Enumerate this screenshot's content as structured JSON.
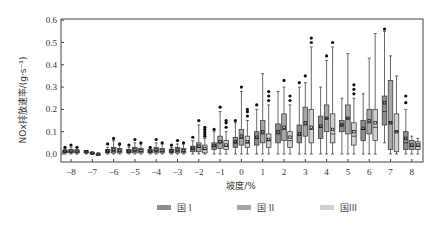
{
  "chart_data": {
    "type": "box",
    "title": "",
    "xlabel": "坡度/%",
    "ylabel": "NOx排放速率/(g·s⁻¹)",
    "ylim": [
      0.0,
      0.6
    ],
    "yticks": [
      "0.0",
      "0.1",
      "0.2",
      "0.3",
      "0.4",
      "0.5",
      "0.6"
    ],
    "categories": [
      "-8",
      "-7",
      "-6",
      "-5",
      "-4",
      "-3",
      "-2",
      "-1",
      "0",
      "1",
      "2",
      "3",
      "4",
      "5",
      "6",
      "7",
      "8"
    ],
    "grid": false,
    "legend_position": "bottom",
    "series": [
      {
        "name": "国 I",
        "color": "#8c8c8c",
        "boxes": [
          {
            "q1": 0.005,
            "median": 0.01,
            "q3": 0.018,
            "mean": 0.012,
            "low": 0.0,
            "high": 0.025,
            "outliers": [
              0.03
            ]
          },
          {
            "q1": 0.005,
            "median": 0.01,
            "q3": 0.015,
            "mean": 0.01,
            "low": 0.0,
            "high": 0.015,
            "outliers": []
          },
          {
            "q1": 0.005,
            "median": 0.012,
            "q3": 0.02,
            "mean": 0.012,
            "low": 0.0,
            "high": 0.03,
            "outliers": [
              0.045
            ]
          },
          {
            "q1": 0.005,
            "median": 0.012,
            "q3": 0.02,
            "mean": 0.012,
            "low": 0.0,
            "high": 0.03,
            "outliers": [
              0.04
            ]
          },
          {
            "q1": 0.005,
            "median": 0.012,
            "q3": 0.02,
            "mean": 0.012,
            "low": 0.0,
            "high": 0.025,
            "outliers": [
              0.03
            ]
          },
          {
            "q1": 0.005,
            "median": 0.012,
            "q3": 0.022,
            "mean": 0.014,
            "low": 0.0,
            "high": 0.03,
            "outliers": [
              0.04
            ]
          },
          {
            "q1": 0.01,
            "median": 0.022,
            "q3": 0.035,
            "mean": 0.025,
            "low": 0.0,
            "high": 0.06,
            "outliers": [
              0.075
            ]
          },
          {
            "q1": 0.02,
            "median": 0.035,
            "q3": 0.05,
            "mean": 0.038,
            "low": 0.0,
            "high": 0.1,
            "outliers": [
              0.11
            ]
          },
          {
            "q1": 0.03,
            "median": 0.05,
            "q3": 0.075,
            "mean": 0.055,
            "low": 0.0,
            "high": 0.14,
            "outliers": [
              0.15
            ]
          },
          {
            "q1": 0.04,
            "median": 0.07,
            "q3": 0.1,
            "mean": 0.075,
            "low": 0.0,
            "high": 0.2,
            "outliers": [
              0.22
            ]
          },
          {
            "q1": 0.05,
            "median": 0.09,
            "q3": 0.135,
            "mean": 0.1,
            "low": 0.0,
            "high": 0.28,
            "outliers": []
          },
          {
            "q1": 0.05,
            "median": 0.085,
            "q3": 0.13,
            "mean": 0.09,
            "low": 0.0,
            "high": 0.3,
            "outliers": [
              0.32
            ]
          },
          {
            "q1": 0.07,
            "median": 0.12,
            "q3": 0.17,
            "mean": 0.125,
            "low": 0.0,
            "high": 0.3,
            "outliers": []
          },
          {
            "q1": 0.1,
            "median": 0.13,
            "q3": 0.15,
            "mean": 0.13,
            "low": 0.0,
            "high": 0.25,
            "outliers": []
          },
          {
            "q1": 0.06,
            "median": 0.11,
            "q3": 0.15,
            "mean": 0.115,
            "low": 0.0,
            "high": 0.27,
            "outliers": []
          },
          {
            "q1": 0.13,
            "median": 0.19,
            "q3": 0.26,
            "mean": 0.23,
            "low": 0.05,
            "high": 0.55,
            "outliers": [
              0.56
            ]
          },
          {
            "q1": 0.02,
            "median": 0.05,
            "q3": 0.1,
            "mean": 0.07,
            "low": 0.0,
            "high": 0.2,
            "outliers": [
              0.23,
              0.26
            ]
          }
        ]
      },
      {
        "name": "国 II",
        "color": "#a6a6a6",
        "boxes": [
          {
            "q1": 0.005,
            "median": 0.01,
            "q3": 0.02,
            "mean": 0.012,
            "low": 0.0,
            "high": 0.03,
            "outliers": [
              0.04
            ]
          },
          {
            "q1": 0.0,
            "median": 0.003,
            "q3": 0.008,
            "mean": 0.004,
            "low": 0.0,
            "high": 0.008,
            "outliers": []
          },
          {
            "q1": 0.005,
            "median": 0.015,
            "q3": 0.03,
            "mean": 0.018,
            "low": 0.0,
            "high": 0.06,
            "outliers": [
              0.07
            ]
          },
          {
            "q1": 0.005,
            "median": 0.015,
            "q3": 0.03,
            "mean": 0.018,
            "low": 0.0,
            "high": 0.05,
            "outliers": [
              0.065
            ]
          },
          {
            "q1": 0.005,
            "median": 0.015,
            "q3": 0.03,
            "mean": 0.018,
            "low": 0.0,
            "high": 0.05,
            "outliers": [
              0.065
            ]
          },
          {
            "q1": 0.005,
            "median": 0.015,
            "q3": 0.03,
            "mean": 0.018,
            "low": 0.0,
            "high": 0.045,
            "outliers": [
              0.06
            ]
          },
          {
            "q1": 0.01,
            "median": 0.03,
            "q3": 0.05,
            "mean": 0.035,
            "low": 0.0,
            "high": 0.13,
            "outliers": [
              0.15
            ]
          },
          {
            "q1": 0.025,
            "median": 0.05,
            "q3": 0.08,
            "mean": 0.055,
            "low": 0.0,
            "high": 0.19,
            "outliers": [
              0.21
            ]
          },
          {
            "q1": 0.04,
            "median": 0.07,
            "q3": 0.11,
            "mean": 0.08,
            "low": 0.0,
            "high": 0.28,
            "outliers": [
              0.3
            ]
          },
          {
            "q1": 0.05,
            "median": 0.09,
            "q3": 0.15,
            "mean": 0.1,
            "low": 0.0,
            "high": 0.36,
            "outliers": []
          },
          {
            "q1": 0.06,
            "median": 0.11,
            "q3": 0.18,
            "mean": 0.12,
            "low": 0.0,
            "high": 0.3,
            "outliers": [
              0.33
            ]
          },
          {
            "q1": 0.08,
            "median": 0.13,
            "q3": 0.21,
            "mean": 0.14,
            "low": 0.0,
            "high": 0.32,
            "outliers": [
              0.35
            ]
          },
          {
            "q1": 0.1,
            "median": 0.16,
            "q3": 0.22,
            "mean": 0.16,
            "low": 0.0,
            "high": 0.42,
            "outliers": [
              0.44
            ]
          },
          {
            "q1": 0.09,
            "median": 0.16,
            "q3": 0.22,
            "mean": 0.16,
            "low": 0.0,
            "high": 0.45,
            "outliers": []
          },
          {
            "q1": 0.09,
            "median": 0.14,
            "q3": 0.2,
            "mean": 0.15,
            "low": 0.0,
            "high": 0.43,
            "outliers": []
          },
          {
            "q1": 0.02,
            "median": 0.14,
            "q3": 0.33,
            "mean": 0.14,
            "low": 0.0,
            "high": 0.44,
            "outliers": []
          },
          {
            "q1": 0.02,
            "median": 0.035,
            "q3": 0.06,
            "mean": 0.04,
            "low": 0.0,
            "high": 0.08,
            "outliers": []
          }
        ]
      },
      {
        "name": "国III",
        "color": "#d0d0d0",
        "boxes": [
          {
            "q1": 0.005,
            "median": 0.01,
            "q3": 0.018,
            "mean": 0.011,
            "low": 0.0,
            "high": 0.02,
            "outliers": [
              0.03
            ]
          },
          {
            "q1": 0.0,
            "median": 0.0,
            "q3": 0.0,
            "mean": 0.0,
            "low": 0.0,
            "high": 0.0,
            "outliers": []
          },
          {
            "q1": 0.005,
            "median": 0.012,
            "q3": 0.025,
            "mean": 0.015,
            "low": 0.0,
            "high": 0.04,
            "outliers": [
              0.045
            ]
          },
          {
            "q1": 0.005,
            "median": 0.012,
            "q3": 0.025,
            "mean": 0.015,
            "low": 0.0,
            "high": 0.045,
            "outliers": [
              0.05
            ]
          },
          {
            "q1": 0.005,
            "median": 0.012,
            "q3": 0.025,
            "mean": 0.015,
            "low": 0.0,
            "high": 0.045,
            "outliers": [
              0.05
            ]
          },
          {
            "q1": 0.005,
            "median": 0.012,
            "q3": 0.025,
            "mean": 0.015,
            "low": 0.0,
            "high": 0.045,
            "outliers": [
              0.05
            ]
          },
          {
            "q1": 0.005,
            "median": 0.02,
            "q3": 0.04,
            "mean": 0.025,
            "low": 0.0,
            "high": 0.07,
            "outliers": [
              0.08,
              0.09,
              0.1,
              0.11,
              0.12
            ]
          },
          {
            "q1": 0.02,
            "median": 0.035,
            "q3": 0.06,
            "mean": 0.04,
            "low": 0.0,
            "high": 0.1,
            "outliers": [
              0.12,
              0.14,
              0.15
            ]
          },
          {
            "q1": 0.03,
            "median": 0.05,
            "q3": 0.08,
            "mean": 0.055,
            "low": 0.0,
            "high": 0.15,
            "outliers": [
              0.17,
              0.19,
              0.2
            ]
          },
          {
            "q1": 0.03,
            "median": 0.06,
            "q3": 0.09,
            "mean": 0.065,
            "low": 0.0,
            "high": 0.22,
            "outliers": [
              0.24,
              0.26,
              0.28
            ]
          },
          {
            "q1": 0.03,
            "median": 0.06,
            "q3": 0.1,
            "mean": 0.075,
            "low": 0.0,
            "high": 0.22,
            "outliers": [
              0.24,
              0.26
            ]
          },
          {
            "q1": 0.05,
            "median": 0.11,
            "q3": 0.2,
            "mean": 0.12,
            "low": 0.0,
            "high": 0.48,
            "outliers": [
              0.5,
              0.52
            ]
          },
          {
            "q1": 0.05,
            "median": 0.09,
            "q3": 0.18,
            "mean": 0.11,
            "low": 0.0,
            "high": 0.48,
            "outliers": [
              0.5
            ]
          },
          {
            "q1": 0.04,
            "median": 0.08,
            "q3": 0.14,
            "mean": 0.1,
            "low": 0.0,
            "high": 0.25,
            "outliers": [
              0.27,
              0.29,
              0.31
            ]
          },
          {
            "q1": 0.06,
            "median": 0.12,
            "q3": 0.2,
            "mean": 0.14,
            "low": 0.0,
            "high": 0.54,
            "outliers": []
          },
          {
            "q1": 0.01,
            "median": 0.1,
            "q3": 0.18,
            "mean": 0.1,
            "low": 0.0,
            "high": 0.35,
            "outliers": []
          },
          {
            "q1": 0.02,
            "median": 0.035,
            "q3": 0.055,
            "mean": 0.04,
            "low": 0.0,
            "high": 0.07,
            "outliers": []
          }
        ]
      }
    ]
  },
  "legend": {
    "items": [
      {
        "label": "国 I",
        "color": "#8c8c8c"
      },
      {
        "label": "国 II",
        "color": "#a6a6a6"
      },
      {
        "label": "国III",
        "color": "#d0d0d0"
      }
    ]
  },
  "axes": {
    "xlabel": "坡度/%",
    "ylabel": "NOx排放速率/(g·s⁻¹)"
  }
}
